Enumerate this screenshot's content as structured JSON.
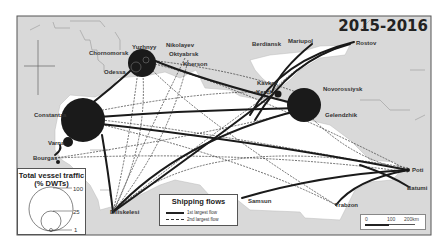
{
  "map": {
    "title": "2015-2016",
    "colors": {
      "land": "#d9d9d9",
      "sea": "#ffffff",
      "border": "#999999",
      "flow": "#222222",
      "port": "#1a1a1a"
    },
    "ports": [
      {
        "name": "Chornomorsk",
        "x": 97,
        "y": 53
      },
      {
        "name": "Yuzhnyy",
        "x": 145,
        "y": 47
      },
      {
        "name": "Odessa",
        "x": 115,
        "y": 72
      },
      {
        "name": "Nikolayev",
        "x": 181,
        "y": 45
      },
      {
        "name": "Oktyabrsk",
        "x": 183,
        "y": 54
      },
      {
        "name": "Kherson",
        "x": 190,
        "y": 64
      },
      {
        "name": "Berdiansk",
        "x": 268,
        "y": 44
      },
      {
        "name": "Mariupol",
        "x": 310,
        "y": 41
      },
      {
        "name": "Rostov",
        "x": 354,
        "y": 42
      },
      {
        "name": "Kavkaz",
        "x": 272,
        "y": 80
      },
      {
        "name": "Kerch",
        "x": 272,
        "y": 91
      },
      {
        "name": "Novorossiysk",
        "x": 330,
        "y": 88
      },
      {
        "name": "Gelendzhik",
        "x": 333,
        "y": 113
      },
      {
        "name": "Constantza",
        "x": 50,
        "y": 115
      },
      {
        "name": "Varna",
        "x": 53,
        "y": 139
      },
      {
        "name": "Bourgas",
        "x": 43,
        "y": 157
      },
      {
        "name": "Diliskelesi",
        "x": 113,
        "y": 212
      },
      {
        "name": "Samsun",
        "x": 242,
        "y": 198
      },
      {
        "name": "Trabzon",
        "x": 336,
        "y": 205
      },
      {
        "name": "Poti",
        "x": 408,
        "y": 170
      },
      {
        "name": "Batumi",
        "x": 409,
        "y": 187
      }
    ],
    "legend_size": {
      "title_line1": "Total vessel traffic",
      "title_line2": "(% DWTs)",
      "values": [
        "100",
        "25",
        "1"
      ]
    },
    "legend_flows": {
      "title": "Shipping flows",
      "items": [
        {
          "label": "1st largest flow",
          "style": "solid"
        },
        {
          "label": "2nd largest flow",
          "style": "dashed"
        }
      ]
    },
    "scale_bar": {
      "ticks": [
        "0",
        "100",
        "200km"
      ]
    }
  }
}
